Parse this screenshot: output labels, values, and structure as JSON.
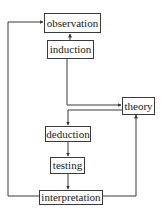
{
  "diagram": {
    "type": "flowchart",
    "nodes": [
      {
        "id": "observation",
        "label": "observation"
      },
      {
        "id": "induction",
        "label": "induction"
      },
      {
        "id": "theory",
        "label": "theory"
      },
      {
        "id": "deduction",
        "label": "deduction"
      },
      {
        "id": "testing",
        "label": "testing"
      },
      {
        "id": "interpretation",
        "label": "interpretation"
      }
    ],
    "edges": [
      {
        "from": "induction",
        "to": "observation"
      },
      {
        "from": "induction",
        "to": "theory"
      },
      {
        "from": "theory",
        "to": "deduction"
      },
      {
        "from": "deduction",
        "to": "testing"
      },
      {
        "from": "testing",
        "to": "interpretation"
      },
      {
        "from": "interpretation",
        "to": "observation"
      },
      {
        "from": "interpretation",
        "to": "theory"
      }
    ],
    "colors": {
      "line": "#3a3a3a",
      "box_border": "#3a3a3a",
      "text": "#1a1a1a",
      "background": "#ffffff"
    }
  }
}
